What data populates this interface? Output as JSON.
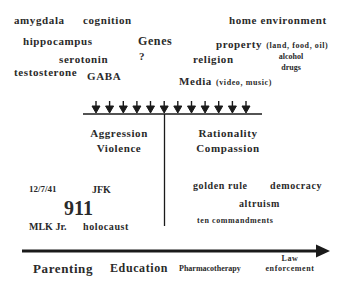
{
  "influences": {
    "biological": [
      {
        "id": "amygdala",
        "label": "amygdala"
      },
      {
        "id": "cognition",
        "label": "cognition"
      },
      {
        "id": "hippocampus",
        "label": "hippocampus"
      },
      {
        "id": "serotonin",
        "label": "serotonin"
      },
      {
        "id": "testosterone",
        "label": "testosterone"
      },
      {
        "id": "gaba",
        "label": "GABA"
      }
    ],
    "genes": {
      "label": "Genes",
      "mark": "?"
    },
    "environmental": [
      {
        "id": "home",
        "label": "home environment"
      },
      {
        "id": "property",
        "label": "property",
        "detail": "(land, food, oil)"
      },
      {
        "id": "religion",
        "label": "religion"
      },
      {
        "id": "alcohol",
        "label": "alcohol",
        "label2": "drugs"
      },
      {
        "id": "media",
        "label": "Media",
        "detail": "(video, music)"
      }
    ]
  },
  "arrows": {
    "count": 12,
    "color": "#1a1a1a"
  },
  "left_column": {
    "title_line1": "Aggression",
    "title_line2": "Violence",
    "events": {
      "date": "12/7/41",
      "jfk": "JFK",
      "nine_eleven": "911",
      "mlk": "MLK Jr.",
      "holocaust": "holocaust"
    }
  },
  "right_column": {
    "title_line1": "Rationality",
    "title_line2": "Compassion",
    "concepts": {
      "golden_rule": "golden rule",
      "democracy": "democracy",
      "altruism": "altruism",
      "ten_commandments": "ten commandments"
    }
  },
  "interventions": [
    {
      "id": "parenting",
      "label": "Parenting"
    },
    {
      "id": "education",
      "label": "Education"
    },
    {
      "id": "pharmacotherapy",
      "label": "Pharmacotherapy"
    },
    {
      "id": "law",
      "label": "Law",
      "label2": "enforcement"
    }
  ]
}
